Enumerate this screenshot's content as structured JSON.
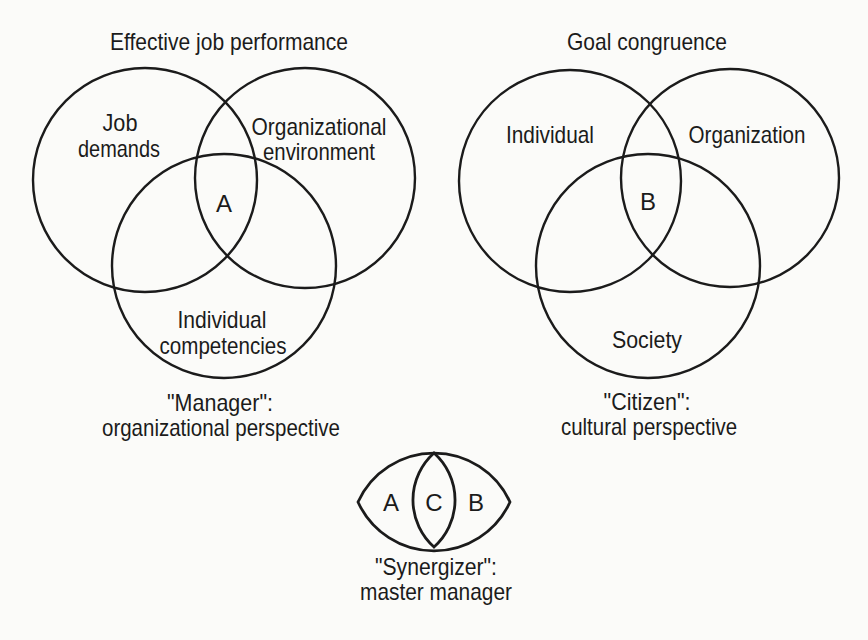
{
  "figure": {
    "type": "venn-diagram-figure",
    "ink_color": "#1b1b1b",
    "background_color": "#fbfbf9"
  },
  "diagrams": {
    "left": {
      "title": "Effective job performance",
      "circle1_line1": "Job",
      "circle1_line2": "demands",
      "circle2_line1": "Organizational",
      "circle2_line2": "environment",
      "center_label": "A",
      "circle3_line1": "Individual",
      "circle3_line2": "competencies",
      "caption_line1": "\"Manager\":",
      "caption_line2": "organizational perspective"
    },
    "right": {
      "title": "Goal congruence",
      "circle1_label": "Individual",
      "circle2_label": "Organization",
      "center_label": "B",
      "circle3_label": "Society",
      "caption_line1": "\"Citizen\":",
      "caption_line2": "cultural perspective"
    },
    "synergizer": {
      "left_label": "A",
      "center_label": "C",
      "right_label": "B",
      "caption_line1": "\"Synergizer\":",
      "caption_line2": "master manager"
    }
  }
}
